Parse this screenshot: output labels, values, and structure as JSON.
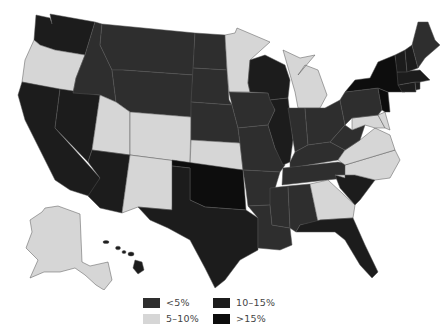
{
  "legend": {
    "items": [
      {
        "label": "<5%",
        "color": "#2e2e2e"
      },
      {
        "label": "5–10%",
        "color": "#d6d6d6"
      },
      {
        "label": "10–15%",
        "color": "#1c1c1c"
      },
      {
        "label": ">15%",
        "color": "#0d0d0d"
      }
    ]
  },
  "states": {
    "WA": "10-15%",
    "OR": "5-10%",
    "CA": "10-15%",
    "NV": "10-15%",
    "ID": "<5%",
    "MT": "<5%",
    "WY": "<5%",
    "UT": "5-10%",
    "CO": "5-10%",
    "AZ": "10-15%",
    "NM": "5-10%",
    "ND": "<5%",
    "SD": "<5%",
    "NE": "<5%",
    "KS": "5-10%",
    "OK": ">15%",
    "TX": "10-15%",
    "MN": "5-10%",
    "IA": "<5%",
    "MO": "<5%",
    "AR": "<5%",
    "LA": "<5%",
    "WI": "10-15%",
    "IL": "10-15%",
    "MI": "5-10%",
    "IN": "<5%",
    "OH": "<5%",
    "KY": "<5%",
    "TN": "<5%",
    "MS": "<5%",
    "AL": "<5%",
    "GA": "5-10%",
    "FL": "10-15%",
    "SC": "10-15%",
    "NC": "5-10%",
    "VA": "5-10%",
    "WV": "<5%",
    "MD": "5-10%",
    "DE": "5-10%",
    "PA": "<5%",
    "NJ": ">15%",
    "NY": ">15%",
    "CT": "10-15%",
    "RI": "10-15%",
    "MA": "10-15%",
    "VT": "10-15%",
    "NH": "10-15%",
    "ME": "<5%",
    "AK": "5-10%",
    "HI": "10-15%"
  }
}
